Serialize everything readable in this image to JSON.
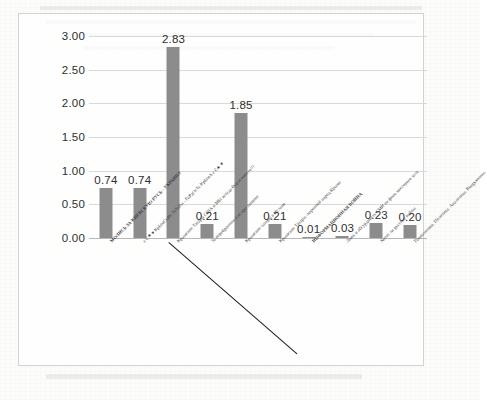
{
  "chart_data": {
    "type": "bar",
    "title": "",
    "xlabel": "",
    "ylabel": "",
    "ylim": [
      0,
      3.0
    ],
    "grid": true,
    "legend": "none",
    "bar_color": "#8c8c8c",
    "y_ticks": [
      "0.00",
      "0.50",
      "1.00",
      "1.50",
      "2.00",
      "2.50",
      "3.00"
    ],
    "y_tick_values": [
      0.0,
      0.5,
      1.0,
      1.5,
      2.0,
      2.5,
      3.0
    ],
    "categories": [
      "МОЛИСЬ ЗА КИЕВСКУЮ РУСЬ - УКРАИНУ",
      "є С★ ♥ КрЫмСкИе ТаТаРы - ГоРдОсТь КрЫмА  є С★ ♥",
      "Крымские Татары США и МЫ всегда будем вместе!!!",
      "За перебранном или про хищное",
      "Крымские татары в Исламе",
      "Крымские Татары -коренной народ Крыма",
      "ИНФОРМАЦИОННАЯ ВОЙНА",
      "Ложь и абсурдность СМИ на фоне массового зала",
      "Хотят ли русские войны",
      "Геополитика. Политика. Аналитика. Вооружение."
    ],
    "values": [
      0.74,
      0.74,
      2.83,
      0.21,
      1.85,
      0.21,
      0.01,
      0.03,
      0.23,
      0.2
    ],
    "data_labels": [
      "0.74",
      "0.74",
      "2.83",
      "0.21",
      "1.85",
      "0.21",
      "0.01",
      "0.03",
      "0.23",
      "0.20"
    ]
  }
}
